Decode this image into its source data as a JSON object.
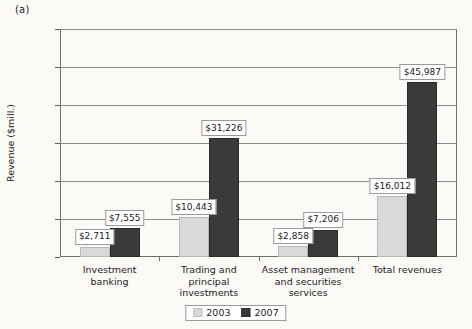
{
  "figure": {
    "caption": "(a)"
  },
  "chart_data": {
    "type": "bar",
    "title": "",
    "xlabel": "",
    "ylabel": "Revenue ($mill.)",
    "ylim": [
      0,
      60000
    ],
    "ytick_values": [
      0,
      10000,
      20000,
      30000,
      40000,
      50000,
      60000
    ],
    "ytick_labels": [
      "0",
      "10,000",
      "20,000",
      "30,000",
      "40,000",
      "50,000",
      "60,000"
    ],
    "grid": true,
    "legend_position": "bottom-center",
    "categories": [
      "Investment banking",
      "Trading and principal investments",
      "Asset management and securities services",
      "Total revenues"
    ],
    "category_label_lines": [
      [
        "Investment",
        "banking"
      ],
      [
        "Trading and",
        "principal",
        "investments"
      ],
      [
        "Asset management",
        "and securities",
        "services"
      ],
      [
        "Total revenues"
      ]
    ],
    "series": [
      {
        "name": "2003",
        "color": "#d9d9d9",
        "values": [
          2711,
          10443,
          2858,
          16012
        ],
        "data_labels": [
          "$2,711",
          "$10,443",
          "$2,858",
          "$16,012"
        ]
      },
      {
        "name": "2007",
        "color": "#3a3a3a",
        "values": [
          7555,
          31226,
          7206,
          45987
        ],
        "data_labels": [
          "$7,555",
          "$31,226",
          "$7,206",
          "$45,987"
        ]
      }
    ]
  },
  "legend": {
    "items": [
      {
        "label": "2003",
        "color": "#d9d9d9"
      },
      {
        "label": "2007",
        "color": "#3a3a3a"
      }
    ]
  }
}
